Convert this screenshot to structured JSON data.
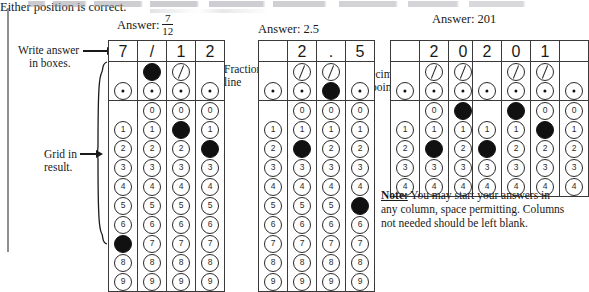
{
  "labels": {
    "write_answer_line1": "Write answer",
    "write_answer_line2": "in boxes.",
    "grid_in_line1": "Grid in",
    "grid_in_line2": "result.",
    "fraction_line_line1": "Fraction",
    "fraction_line_line2": "line",
    "decimal_point_line1": "Decimal",
    "decimal_point_line2": "point"
  },
  "headings": {
    "answer_prefix": "Answer:",
    "fraction_numerator": "7",
    "fraction_denominator": "12",
    "answer_decimal": "Answer: 2.5",
    "answer_201": "Answer:  201",
    "either_position": "Either position is correct."
  },
  "note": {
    "label": "Note:",
    "text": " You may start your answers in any column, space permitting. Columns not needed should be left blank."
  },
  "bubble_rows": {
    "slash_row": "slash",
    "dot_row": "dot",
    "digits": [
      "0",
      "1",
      "2",
      "3",
      "4",
      "5",
      "6",
      "7",
      "8",
      "9"
    ]
  },
  "grids": [
    {
      "name": "grid-fraction",
      "digit_count": 10,
      "columns": [
        {
          "written": "7",
          "has_slash": false,
          "has_dot": true,
          "has_zero": false,
          "filled": "7"
        },
        {
          "written": "/",
          "has_slash": true,
          "has_dot": true,
          "has_zero": true,
          "filled": "slash"
        },
        {
          "written": "1",
          "has_slash": true,
          "has_dot": true,
          "has_zero": true,
          "filled": "1"
        },
        {
          "written": "2",
          "has_slash": false,
          "has_dot": true,
          "has_zero": true,
          "filled": "2"
        }
      ]
    },
    {
      "name": "grid-decimal",
      "digit_count": 10,
      "columns": [
        {
          "written": "",
          "has_slash": false,
          "has_dot": true,
          "has_zero": false,
          "filled": ""
        },
        {
          "written": "2",
          "has_slash": true,
          "has_dot": true,
          "has_zero": true,
          "filled": "2"
        },
        {
          "written": ".",
          "has_slash": true,
          "has_dot": true,
          "has_zero": true,
          "filled": "dot"
        },
        {
          "written": "5",
          "has_slash": false,
          "has_dot": true,
          "has_zero": true,
          "filled": "5"
        }
      ]
    },
    {
      "name": "grid-201-a",
      "digit_count": 5,
      "columns": [
        {
          "written": "",
          "has_slash": false,
          "has_dot": true,
          "has_zero": false,
          "filled": ""
        },
        {
          "written": "2",
          "has_slash": true,
          "has_dot": true,
          "has_zero": true,
          "filled": "2"
        },
        {
          "written": "0",
          "has_slash": true,
          "has_dot": true,
          "has_zero": true,
          "filled": "0"
        },
        {
          "written": "1",
          "has_slash": false,
          "has_dot": true,
          "has_zero": true,
          "filled": "1"
        }
      ]
    },
    {
      "name": "grid-201-b",
      "digit_count": 5,
      "columns": [
        {
          "written": "2",
          "has_slash": false,
          "has_dot": true,
          "has_zero": false,
          "filled": "2"
        },
        {
          "written": "0",
          "has_slash": true,
          "has_dot": true,
          "has_zero": true,
          "filled": "0"
        },
        {
          "written": "1",
          "has_slash": true,
          "has_dot": true,
          "has_zero": true,
          "filled": "1"
        },
        {
          "written": "",
          "has_slash": false,
          "has_dot": true,
          "has_zero": true,
          "filled": ""
        }
      ]
    }
  ]
}
